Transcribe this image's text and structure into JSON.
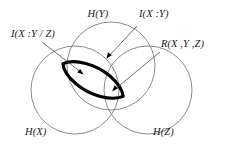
{
  "figure": {
    "kind": "venn-information-diagram",
    "background_color": "#ffffff",
    "circle_stroke_color": "#7d7d7d",
    "highlight_stroke_color": "#000000",
    "label_color": "#1a1a1a",
    "labels": {
      "entropy_y": "H(Y)",
      "entropy_x": "H(X)",
      "entropy_z": "H(Z)",
      "mutual_information": "I(X :Y)",
      "conditional_mutual_information": "I(X :Y / Z)",
      "interaction_information": "R(X ,Y ,Z)"
    },
    "circles": [
      {
        "name": "H(Y)",
        "cx": 111,
        "cy": 66,
        "r": 44
      },
      {
        "name": "H(X)",
        "cx": 75,
        "cy": 90,
        "r": 44
      },
      {
        "name": "H(Z)",
        "cx": 148,
        "cy": 90,
        "r": 44
      }
    ]
  }
}
